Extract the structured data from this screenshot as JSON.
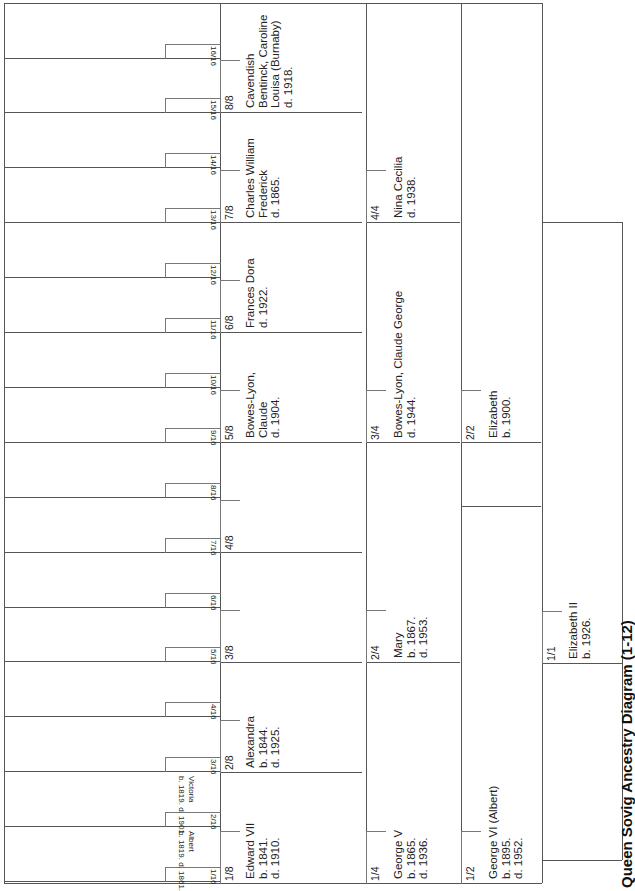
{
  "diagram": {
    "title": "Queen Sovig Ancestry Diagram (1-12)",
    "orientation": "rotated-90-ccw",
    "generations": [
      {
        "generation": 1,
        "people": [
          {
            "pos": "1/1",
            "name": "Elizabeth II",
            "line1": "b. 1926.",
            "line2": ""
          }
        ]
      },
      {
        "generation": 2,
        "people": [
          {
            "pos": "1/2",
            "name": "George VI (Albert)",
            "line1": "b. 1895.",
            "line2": "d. 1952."
          },
          {
            "pos": "2/2",
            "name": "Elizabeth",
            "line1": "b. 1900.",
            "line2": ""
          }
        ]
      },
      {
        "generation": 3,
        "people": [
          {
            "pos": "1/4",
            "name": "George V",
            "line1": "b. 1865.",
            "line2": "d. 1936."
          },
          {
            "pos": "2/4",
            "name": "Mary",
            "line1": "b. 1867.",
            "line2": "d. 1953."
          },
          {
            "pos": "3/4",
            "name": "Bowes-Lyon, Claude George",
            "line1": "d. 1944.",
            "line2": ""
          },
          {
            "pos": "4/4",
            "name": "Nina Cecilia",
            "line1": "d. 1938.",
            "line2": ""
          }
        ]
      },
      {
        "generation": 4,
        "people": [
          {
            "pos": "1/8",
            "name": "Edward VII",
            "line1": "b. 1841.",
            "line2": "d. 1910."
          },
          {
            "pos": "2/8",
            "name": "Alexandra",
            "line1": "b. 1844.",
            "line2": "d. 1925."
          },
          {
            "pos": "3/8",
            "name": "",
            "line1": "",
            "line2": ""
          },
          {
            "pos": "4/8",
            "name": "",
            "line1": "",
            "line2": ""
          },
          {
            "pos": "5/8",
            "name": "Bowes-Lyon,",
            "line1": "Claude",
            "line2": "d. 1904."
          },
          {
            "pos": "6/8",
            "name": "Frances Dora",
            "line1": "d. 1922.",
            "line2": ""
          },
          {
            "pos": "7/8",
            "name": "Charles William",
            "line1": "Frederick",
            "line2": "d. 1865."
          },
          {
            "pos": "8/8",
            "name": "Cavendish",
            "line1": "Bentinck, Caroline",
            "line2": "Louisa (Burnaby)",
            "line3": "d. 1918."
          }
        ]
      },
      {
        "generation": 5,
        "people": [
          {
            "pos": "1/16",
            "name": "Albert",
            "line1": "b. 1819. d. 1861."
          },
          {
            "pos": "2/16",
            "name": "Victoria",
            "line1": "b. 1819. d. 1901."
          },
          {
            "pos": "3/16",
            "name": "",
            "line1": ""
          },
          {
            "pos": "4/16",
            "name": "",
            "line1": ""
          },
          {
            "pos": "5/16",
            "name": "",
            "line1": ""
          },
          {
            "pos": "6/16",
            "name": "",
            "line1": ""
          },
          {
            "pos": "7/16",
            "name": "",
            "line1": ""
          },
          {
            "pos": "8/16",
            "name": "",
            "line1": ""
          },
          {
            "pos": "9/16",
            "name": "",
            "line1": ""
          },
          {
            "pos": "10/16",
            "name": "",
            "line1": ""
          },
          {
            "pos": "11/16",
            "name": "",
            "line1": ""
          },
          {
            "pos": "12/16",
            "name": "",
            "line1": ""
          },
          {
            "pos": "13/16",
            "name": "",
            "line1": ""
          },
          {
            "pos": "14/16",
            "name": "",
            "line1": ""
          },
          {
            "pos": "15/16",
            "name": "",
            "line1": ""
          },
          {
            "pos": "16/16",
            "name": "",
            "line1": ""
          }
        ]
      }
    ]
  }
}
